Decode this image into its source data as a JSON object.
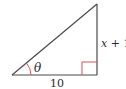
{
  "diagram": {
    "type": "right-triangle",
    "angle_label": "θ",
    "base_label": "10",
    "side_label_var": "x",
    "side_label_rest": " + 1",
    "colors": {
      "stroke": "#4a4a4a",
      "marker": "#d9534f",
      "text": "#2a2a2a"
    }
  }
}
